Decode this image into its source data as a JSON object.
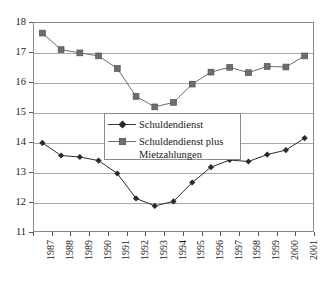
{
  "chart_data": {
    "type": "line",
    "title": "",
    "xlabel": "",
    "ylabel": "",
    "categories": [
      "1987",
      "1988",
      "1989",
      "1990",
      "1991",
      "1992",
      "1993",
      "1994",
      "1995",
      "1996",
      "1997",
      "1998",
      "1999",
      "2000",
      "2001"
    ],
    "ylim": [
      11,
      18
    ],
    "yticks": [
      11,
      12,
      13,
      14,
      15,
      16,
      17,
      18
    ],
    "ytick_labels": [
      "11",
      "12",
      "13",
      "14",
      "15",
      "16",
      "17",
      "18"
    ],
    "grid": true,
    "legend_position": "center",
    "series": [
      {
        "name": "Schuldendienst",
        "marker": "diamond",
        "color": "#2b2b2b",
        "values": [
          13.97,
          13.55,
          13.5,
          13.38,
          12.95,
          12.12,
          11.87,
          12.02,
          12.65,
          13.16,
          13.4,
          13.35,
          13.58,
          13.73,
          14.13
        ]
      },
      {
        "name": "Schuldendienst plus\nMietzahlungen",
        "marker": "square",
        "color": "#6e6e6e",
        "values": [
          17.63,
          17.08,
          16.97,
          16.87,
          16.45,
          15.52,
          15.17,
          15.32,
          15.93,
          16.33,
          16.49,
          16.31,
          16.52,
          16.5,
          16.87
        ]
      }
    ]
  },
  "legend": {
    "items": [
      {
        "label": "Schuldendienst"
      },
      {
        "label": "Schuldendienst plus\nMietzahlungen"
      }
    ]
  },
  "colors": {
    "series_1": "#2b2b2b",
    "series_2": "#6e6e6e",
    "gridline": "#a9a9a9",
    "frame": "#8a8a8a",
    "background": "#ffffff",
    "text": "#1a1a1a"
  }
}
